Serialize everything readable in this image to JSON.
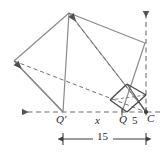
{
  "figure": {
    "type": "geometry-diagram",
    "labels": {
      "q_prime": "Q′",
      "x": "x",
      "q": "Q",
      "five": "5",
      "c": "C",
      "fifteen": "15"
    },
    "colors": {
      "solid_stroke": "#8a8a8a",
      "dashed_stroke": "#6f6f6f",
      "small_square_stroke": "#4a4a4a",
      "dimension_stroke": "#3d3d3d",
      "text": "#2b2b2b",
      "background": "#ffffff"
    },
    "geometry": {
      "points": {
        "C": [
          146,
          112
        ],
        "Q": [
          122,
          112
        ],
        "Q_prime": [
          63,
          112
        ],
        "big_square_top": [
          69,
          13
        ],
        "big_square_right": [
          145,
          43
        ],
        "big_square_left": [
          14,
          61
        ],
        "small_square_top": [
          127,
          84
        ],
        "small_square_right": [
          146,
          95
        ],
        "small_square_bottom": [
          127,
          112
        ],
        "small_square_left": [
          110,
          100
        ]
      },
      "solid_segments": [
        [
          63,
          112,
          69,
          13
        ],
        [
          69,
          13,
          145,
          43
        ],
        [
          145,
          43,
          122,
          112
        ],
        [
          69,
          13,
          146,
          112
        ],
        [
          14,
          61,
          63,
          112
        ],
        [
          14,
          61,
          69,
          13
        ],
        [
          110,
          100,
          127,
          84
        ],
        [
          127,
          84,
          146,
          95
        ],
        [
          146,
          95,
          127,
          112
        ],
        [
          127,
          112,
          110,
          100
        ],
        [
          127,
          84,
          146,
          112
        ],
        [
          110,
          100,
          146,
          95
        ]
      ],
      "dashed_segments": [
        [
          69,
          13,
          146,
          112
        ],
        [
          14,
          61,
          146,
          112
        ],
        [
          110,
          100,
          146,
          95
        ],
        [
          127,
          84,
          146,
          112
        ]
      ],
      "axis": {
        "y": 112,
        "x_start": 18,
        "x_end": 160,
        "arrow_left": true
      },
      "vertical_ray": {
        "x": 146,
        "y_start": 112,
        "y_end": 8,
        "arrow_up": true
      },
      "dimension_line": {
        "y": 139,
        "x_start": 63,
        "x_end": 146,
        "value": "15"
      },
      "tick_marks": [
        {
          "x": 122,
          "y": 112
        },
        {
          "x": 146,
          "y": 112
        }
      ]
    }
  }
}
